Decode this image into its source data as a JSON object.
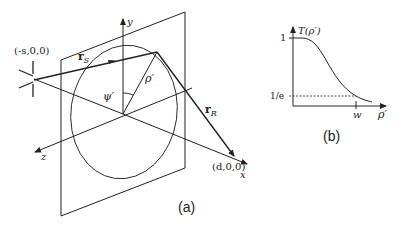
{
  "figure": {
    "panel_a": {
      "caption": "(a)",
      "axes": {
        "x": "x",
        "y": "y",
        "z": "z"
      },
      "source_point": "(-s,0,0)",
      "receiver_point": "(d,0,0)",
      "vector_source": "r",
      "vector_source_sub": "S",
      "vector_receiver": "r",
      "vector_receiver_sub": "R",
      "radius_label": "ρ′",
      "angle_label": "ψ′"
    },
    "panel_b": {
      "caption": "(b)",
      "y_label": "T(ρ′)",
      "x_label": "ρ′",
      "y_tick_top": "1",
      "y_tick_level": "1/e",
      "x_tick": "w"
    }
  },
  "colors": {
    "ink": "#222222",
    "background": "#ffffff"
  }
}
